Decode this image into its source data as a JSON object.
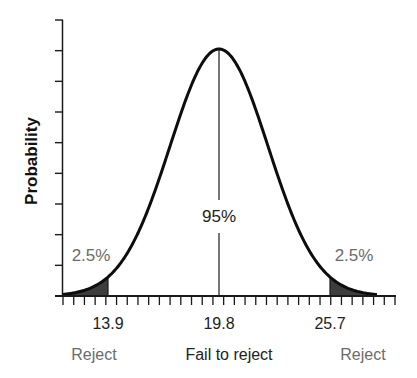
{
  "chart_data": {
    "type": "area",
    "title": "",
    "subtitle": "",
    "xlabel": "",
    "ylabel": "Probability",
    "distribution": "normal",
    "mean": 19.8,
    "critical_values": [
      13.9,
      25.7
    ],
    "x_tick_labels": [
      "13.9",
      "19.8",
      "25.7"
    ],
    "y_tick_labels": [],
    "regions": [
      {
        "name": "Reject",
        "side": "left",
        "probability_label": "2.5%",
        "shaded": true
      },
      {
        "name": "Fail to reject",
        "side": "center",
        "probability_label": "95%",
        "shaded": false
      },
      {
        "name": "Reject",
        "side": "right",
        "probability_label": "2.5%",
        "shaded": true
      }
    ],
    "annotations": [
      "2.5%",
      "95%",
      "2.5%"
    ],
    "grid": false,
    "legend": null,
    "y_major_ticks": 10,
    "x_minor_ticks": 32
  },
  "labels": {
    "ylabel": "Probability",
    "left_tail_pct": "2.5%",
    "center_pct": "95%",
    "right_tail_pct": "2.5%",
    "x_left": "13.9",
    "x_center": "19.8",
    "x_right": "25.7",
    "region_left": "Reject",
    "region_center": "Fail to reject",
    "region_right": "Reject"
  },
  "colors": {
    "axis": "#1a1a1a",
    "curve": "#0d0d0d",
    "shade": "#3d3d3d",
    "text_dark": "#222222",
    "text_gray": "#6b6b6b"
  }
}
